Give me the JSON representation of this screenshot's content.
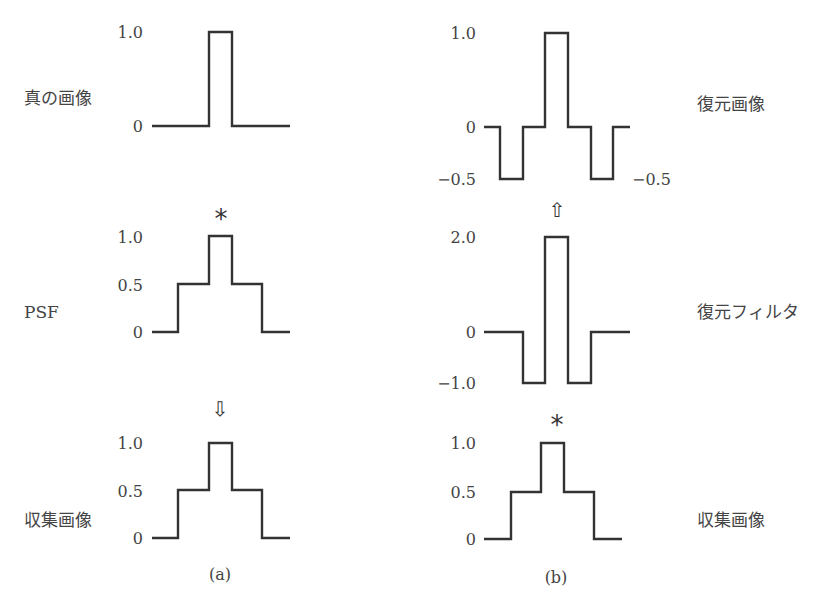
{
  "panels": {
    "a": {
      "caption": "(a)",
      "plots": [
        {
          "id": "true-image",
          "label": "真の画像",
          "label_pos": [
            24,
            104
          ],
          "ticks": [
            {
              "text": "1.0",
              "y": 38,
              "x": 143
            },
            {
              "text": "0",
              "y": 132,
              "x": 143
            }
          ],
          "points": [
            [
              152,
              126
            ],
            [
              209,
              126
            ],
            [
              209,
              32
            ],
            [
              232,
              32
            ],
            [
              232,
              126
            ],
            [
              290,
              126
            ]
          ]
        },
        {
          "id": "psf",
          "label": "PSF",
          "label_pos": [
            24,
            318
          ],
          "ticks": [
            {
              "text": "1.0",
              "y": 243,
              "x": 143
            },
            {
              "text": "0.5",
              "y": 291,
              "x": 143
            },
            {
              "text": "0",
              "y": 338,
              "x": 143
            }
          ],
          "points": [
            [
              152,
              332
            ],
            [
              178,
              332
            ],
            [
              178,
              284
            ],
            [
              209,
              284
            ],
            [
              209,
              236
            ],
            [
              232,
              236
            ],
            [
              232,
              284
            ],
            [
              262,
              284
            ],
            [
              262,
              332
            ],
            [
              290,
              332
            ]
          ]
        },
        {
          "id": "observed-image-a",
          "label": "収集画像",
          "label_pos": [
            24,
            526
          ],
          "ticks": [
            {
              "text": "1.0",
              "y": 449,
              "x": 143
            },
            {
              "text": "0.5",
              "y": 497,
              "x": 143
            },
            {
              "text": "0",
              "y": 544,
              "x": 143
            }
          ],
          "points": [
            [
              152,
              538
            ],
            [
              178,
              538
            ],
            [
              178,
              490
            ],
            [
              209,
              490
            ],
            [
              209,
              443
            ],
            [
              232,
              443
            ],
            [
              232,
              490
            ],
            [
              262,
              490
            ],
            [
              262,
              538
            ],
            [
              290,
              538
            ]
          ]
        }
      ],
      "operators": [
        {
          "id": "convolution-symbol",
          "text": "*",
          "x": 221,
          "y": 228,
          "kind": "sym"
        },
        {
          "id": "arrow-down",
          "text": "⇩",
          "x": 220,
          "y": 416,
          "kind": "arrow"
        }
      ],
      "caption_pos": [
        220,
        580
      ]
    },
    "b": {
      "caption": "(b)",
      "plots": [
        {
          "id": "restored-image",
          "label": "復元画像",
          "label_pos": [
            697,
            110
          ],
          "ticks": [
            {
              "text": "1.0",
              "y": 39,
              "x": 476
            },
            {
              "text": "0",
              "y": 133,
              "x": 476
            },
            {
              "text": "−0.5",
              "y": 185,
              "x": 476
            },
            {
              "text": "−0.5",
              "y": 185,
              "x": 632,
              "anchor": "start"
            }
          ],
          "points": [
            [
              484,
              127
            ],
            [
              500,
              127
            ],
            [
              500,
              179
            ],
            [
              523,
              179
            ],
            [
              523,
              127
            ],
            [
              545,
              127
            ],
            [
              545,
              33
            ],
            [
              568,
              33
            ],
            [
              568,
              127
            ],
            [
              591,
              127
            ],
            [
              591,
              179
            ],
            [
              613,
              179
            ],
            [
              613,
              127
            ],
            [
              630,
              127
            ]
          ]
        },
        {
          "id": "restoration-filter",
          "label": "復元フィルタ",
          "label_pos": [
            697,
            318
          ],
          "ticks": [
            {
              "text": "2.0",
              "y": 243,
              "x": 476
            },
            {
              "text": "0",
              "y": 338,
              "x": 476
            },
            {
              "text": "−1.0",
              "y": 389,
              "x": 476
            }
          ],
          "points": [
            [
              484,
              332
            ],
            [
              523,
              332
            ],
            [
              523,
              383
            ],
            [
              545,
              383
            ],
            [
              545,
              237
            ],
            [
              568,
              237
            ],
            [
              568,
              383
            ],
            [
              591,
              383
            ],
            [
              591,
              332
            ],
            [
              630,
              332
            ]
          ]
        },
        {
          "id": "observed-image-b",
          "label": "収集画像",
          "label_pos": [
            697,
            526
          ],
          "ticks": [
            {
              "text": "1.0",
              "y": 449,
              "x": 476
            },
            {
              "text": "0.5",
              "y": 498,
              "x": 476
            },
            {
              "text": "0",
              "y": 545,
              "x": 476
            }
          ],
          "points": [
            [
              484,
              539
            ],
            [
              511,
              539
            ],
            [
              511,
              492
            ],
            [
              541,
              492
            ],
            [
              541,
              443
            ],
            [
              564,
              443
            ],
            [
              564,
              492
            ],
            [
              594,
              492
            ],
            [
              594,
              539
            ],
            [
              622,
              539
            ]
          ]
        }
      ],
      "operators": [
        {
          "id": "arrow-up",
          "text": "⇧",
          "x": 557,
          "y": 217,
          "kind": "arrow"
        },
        {
          "id": "convolution-symbol",
          "text": "*",
          "x": 557,
          "y": 434,
          "kind": "sym"
        }
      ],
      "caption_pos": [
        556,
        583
      ]
    }
  }
}
